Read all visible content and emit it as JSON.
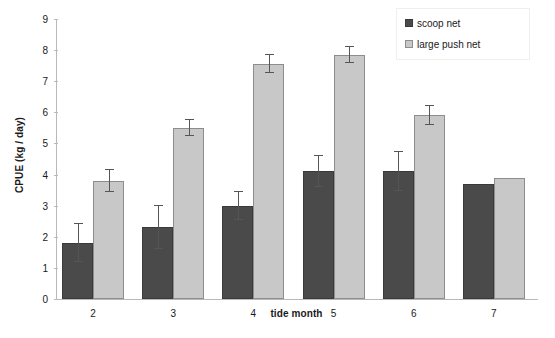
{
  "chart_data": {
    "type": "bar",
    "title": "",
    "xlabel": "tide month",
    "ylabel": "CPUE (kg / day)",
    "categories": [
      "2",
      "3",
      "4",
      "5",
      "6",
      "7"
    ],
    "ylim": [
      0,
      9
    ],
    "yticks": [
      "0",
      "1",
      "2",
      "3",
      "4",
      "5",
      "6",
      "7",
      "8",
      "9"
    ],
    "grid": false,
    "legend_position": "top-right",
    "series": [
      {
        "name": "scoop net",
        "color": "#4a4a4a",
        "values": [
          1.8,
          2.3,
          3.0,
          4.1,
          4.1,
          3.7
        ],
        "errors": [
          0.62,
          0.7,
          0.45,
          0.5,
          0.62,
          0
        ]
      },
      {
        "name": "large push net",
        "color": "#c8c8c8",
        "values": [
          3.8,
          5.5,
          7.55,
          7.85,
          5.9,
          3.9
        ],
        "errors": [
          0.35,
          0.25,
          0.3,
          0.25,
          0.3,
          0
        ]
      }
    ]
  },
  "legend": {
    "items": [
      {
        "label": "scoop net"
      },
      {
        "label": "large push net"
      }
    ]
  }
}
